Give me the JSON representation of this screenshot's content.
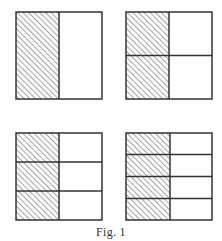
{
  "figure": {
    "caption": "Fig. 1",
    "colors": {
      "stroke": "#333333",
      "hatch": "#555555",
      "background": "#ffffff"
    },
    "squares": [
      {
        "id": "halves",
        "rows": 1,
        "cols": 2,
        "shaded_column": 1,
        "fraction_shaded": "1/2",
        "x": 15,
        "y": 11
      },
      {
        "id": "quarters",
        "rows": 2,
        "cols": 2,
        "shaded_column": 1,
        "fraction_shaded": "2/4",
        "x": 125,
        "y": 11
      },
      {
        "id": "sixths",
        "rows": 3,
        "cols": 2,
        "shaded_column": 1,
        "fraction_shaded": "3/6",
        "x": 15,
        "y": 132
      },
      {
        "id": "eighths",
        "rows": 4,
        "cols": 2,
        "shaded_column": 1,
        "fraction_shaded": "4/8",
        "x": 125,
        "y": 132
      }
    ]
  }
}
